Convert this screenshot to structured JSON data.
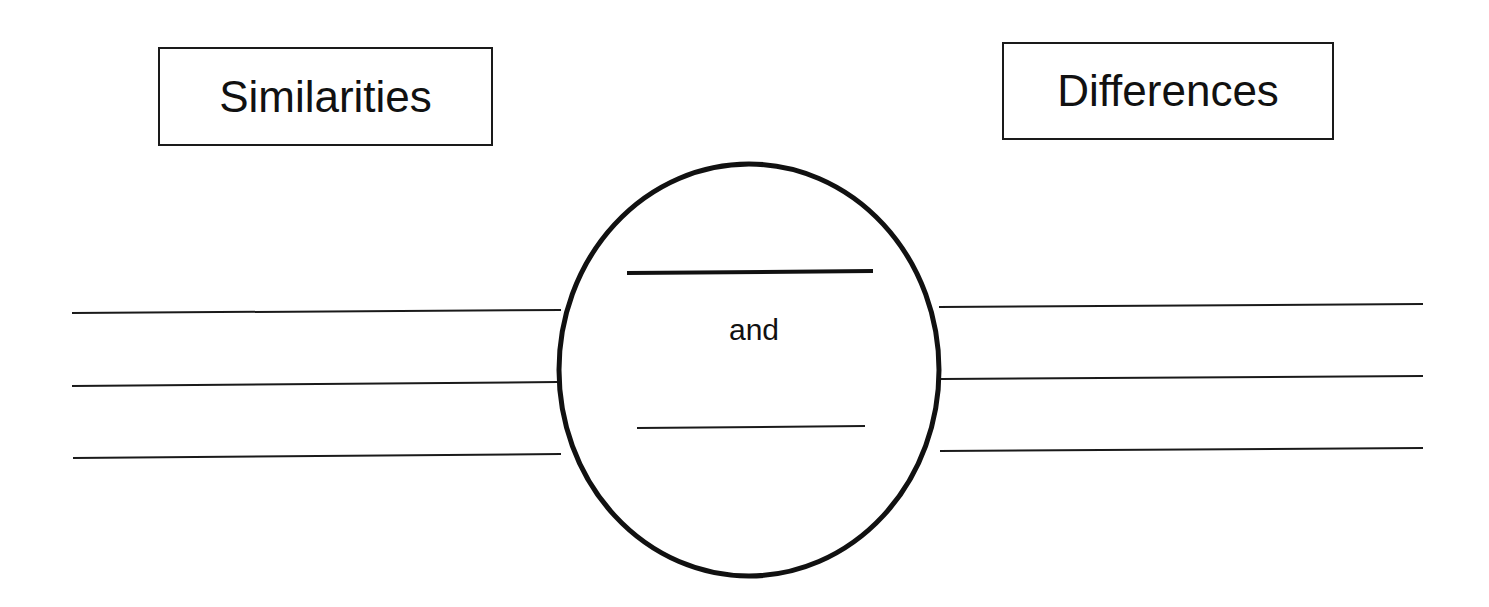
{
  "diagram": {
    "type": "compare-contrast graphic organizer",
    "left_label": "Similarities",
    "right_label": "Differences",
    "center": {
      "shape": "circle",
      "connector_text": "and",
      "blanks": [
        "",
        ""
      ]
    },
    "left_lines": 3,
    "right_lines": 3,
    "colors": {
      "stroke": "#111111",
      "background": "#ffffff"
    }
  }
}
